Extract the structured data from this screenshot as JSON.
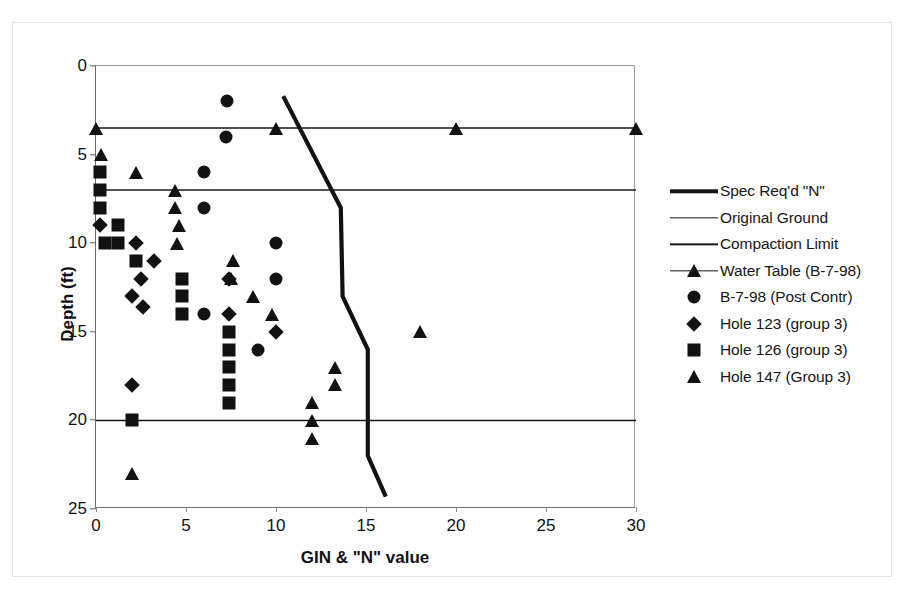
{
  "chart_data": {
    "type": "scatter",
    "title": "",
    "xlabel": "GIN & \"N\" value",
    "ylabel": "Depth (ft)",
    "xlim": [
      0,
      30
    ],
    "ylim": [
      0,
      25
    ],
    "y_inverted": true,
    "xticks": [
      0,
      5,
      10,
      15,
      20,
      25,
      30
    ],
    "yticks": [
      0,
      5,
      10,
      15,
      20,
      25
    ],
    "grid": false,
    "legend_position": "right",
    "series": [
      {
        "name": "Spec Req'd \"N\"",
        "type": "line",
        "marker": "none",
        "linewidth": "thick",
        "color": "#121212",
        "points": [
          {
            "x": 10.4,
            "y": 1.7
          },
          {
            "x": 13.6,
            "y": 8.0
          },
          {
            "x": 13.7,
            "y": 13.0
          },
          {
            "x": 15.1,
            "y": 16.0
          },
          {
            "x": 15.1,
            "y": 22.0
          },
          {
            "x": 16.1,
            "y": 24.3
          }
        ]
      },
      {
        "name": "Original Ground",
        "type": "line",
        "marker": "none",
        "linewidth": "thin",
        "color": "#161616",
        "points": [
          {
            "x": 0,
            "y": 20.0
          },
          {
            "x": 30,
            "y": 20.0
          }
        ]
      },
      {
        "name": "Compaction Limit",
        "type": "line",
        "marker": "none",
        "linewidth": "thin",
        "color": "#161616",
        "points": [
          {
            "x": 0,
            "y": 7.0
          },
          {
            "x": 30,
            "y": 7.0
          }
        ]
      },
      {
        "name": "Water Table (B-7-98)",
        "type": "line",
        "marker": "triangle",
        "linewidth": "thin",
        "color": "#161616",
        "points": [
          {
            "x": 0,
            "y": 3.5
          },
          {
            "x": 10,
            "y": 3.5
          },
          {
            "x": 20,
            "y": 3.5
          },
          {
            "x": 30,
            "y": 3.5
          }
        ]
      },
      {
        "name": "B-7-98 (Post Contr)",
        "type": "scatter",
        "marker": "circle",
        "color": "#121212",
        "points": [
          {
            "x": 7.3,
            "y": 2.0
          },
          {
            "x": 7.2,
            "y": 4.0
          },
          {
            "x": 6.0,
            "y": 6.0
          },
          {
            "x": 6.0,
            "y": 8.0
          },
          {
            "x": 10.0,
            "y": 10.0
          },
          {
            "x": 10.0,
            "y": 12.0
          },
          {
            "x": 6.0,
            "y": 14.0
          },
          {
            "x": 9.0,
            "y": 16.0
          }
        ]
      },
      {
        "name": "Hole 123 (group 3)",
        "type": "scatter",
        "marker": "diamond",
        "color": "#121212",
        "points": [
          {
            "x": 0.2,
            "y": 9.0
          },
          {
            "x": 2.2,
            "y": 10.0
          },
          {
            "x": 3.2,
            "y": 11.0
          },
          {
            "x": 2.5,
            "y": 12.0
          },
          {
            "x": 7.4,
            "y": 12.0
          },
          {
            "x": 2.0,
            "y": 13.0
          },
          {
            "x": 2.6,
            "y": 13.6
          },
          {
            "x": 7.4,
            "y": 14.0
          },
          {
            "x": 10.0,
            "y": 15.0
          },
          {
            "x": 2.0,
            "y": 18.0
          }
        ]
      },
      {
        "name": "Hole 126 (group 3)",
        "type": "scatter",
        "marker": "square",
        "color": "#121212",
        "points": [
          {
            "x": 0.2,
            "y": 6.0
          },
          {
            "x": 0.2,
            "y": 7.0
          },
          {
            "x": 0.2,
            "y": 8.0
          },
          {
            "x": 1.2,
            "y": 9.0
          },
          {
            "x": 0.5,
            "y": 10.0
          },
          {
            "x": 1.2,
            "y": 10.0
          },
          {
            "x": 2.2,
            "y": 11.0
          },
          {
            "x": 4.8,
            "y": 12.0
          },
          {
            "x": 4.8,
            "y": 13.0
          },
          {
            "x": 4.8,
            "y": 14.0
          },
          {
            "x": 7.4,
            "y": 15.0
          },
          {
            "x": 7.4,
            "y": 16.0
          },
          {
            "x": 7.4,
            "y": 17.0
          },
          {
            "x": 7.4,
            "y": 18.0
          },
          {
            "x": 7.4,
            "y": 19.0
          },
          {
            "x": 2.0,
            "y": 20.0
          }
        ]
      },
      {
        "name": "Hole 147 (Group 3)",
        "type": "scatter",
        "marker": "triangle",
        "color": "#121212",
        "points": [
          {
            "x": 0.3,
            "y": 5.0
          },
          {
            "x": 2.2,
            "y": 6.0
          },
          {
            "x": 4.4,
            "y": 7.0
          },
          {
            "x": 4.4,
            "y": 8.0
          },
          {
            "x": 4.6,
            "y": 9.0
          },
          {
            "x": 4.5,
            "y": 10.0
          },
          {
            "x": 7.6,
            "y": 11.0
          },
          {
            "x": 7.5,
            "y": 12.0
          },
          {
            "x": 8.7,
            "y": 13.0
          },
          {
            "x": 9.8,
            "y": 14.0
          },
          {
            "x": 18.0,
            "y": 15.0
          },
          {
            "x": 13.3,
            "y": 17.0
          },
          {
            "x": 13.3,
            "y": 18.0
          },
          {
            "x": 12.0,
            "y": 19.0
          },
          {
            "x": 12.0,
            "y": 20.0
          },
          {
            "x": 12.0,
            "y": 21.0
          },
          {
            "x": 2.0,
            "y": 23.0
          }
        ]
      }
    ],
    "legend_entries": [
      {
        "label": "Spec Req'd \"N\"",
        "kind": "line-thick",
        "marker": "none"
      },
      {
        "label": "Original Ground",
        "kind": "line-thin",
        "marker": "none"
      },
      {
        "label": "Compaction Limit",
        "kind": "line-thin",
        "marker": "none"
      },
      {
        "label": "Water Table (B-7-98)",
        "kind": "line-thin",
        "marker": "triangle"
      },
      {
        "label": "B-7-98 (Post Contr)",
        "kind": "marker",
        "marker": "circle"
      },
      {
        "label": "Hole 123 (group 3)",
        "kind": "marker",
        "marker": "diamond"
      },
      {
        "label": "Hole 126 (group 3)",
        "kind": "marker",
        "marker": "square"
      },
      {
        "label": "Hole 147 (Group 3)",
        "kind": "marker",
        "marker": "triangle"
      }
    ]
  }
}
